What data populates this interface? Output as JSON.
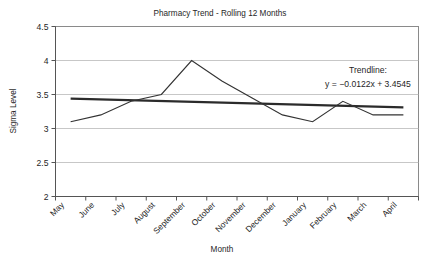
{
  "chart_data": {
    "type": "line",
    "title": "Pharmacy Trend - Rolling 12 Months",
    "xlabel": "Month",
    "ylabel": "Sigma Level",
    "categories": [
      "May",
      "June",
      "July",
      "August",
      "September",
      "October",
      "November",
      "December",
      "January",
      "February",
      "March",
      "April"
    ],
    "ylim": [
      2,
      4.5
    ],
    "yticks": [
      "2",
      "2.5",
      "3",
      "3.5",
      "4",
      "4.5"
    ],
    "ytick_values": [
      2,
      2.5,
      3,
      3.5,
      4,
      4.5
    ],
    "grid": true,
    "legend": "none",
    "series": [
      {
        "name": "Sigma Level",
        "values": [
          3.1,
          3.2,
          3.4,
          3.5,
          4.0,
          3.7,
          3.45,
          3.2,
          3.1,
          3.4,
          3.2,
          3.2
        ]
      },
      {
        "name": "Trendline",
        "values": [
          3.44,
          3.43,
          3.42,
          3.41,
          3.39,
          3.38,
          3.37,
          3.36,
          3.34,
          3.33,
          3.32,
          3.31
        ]
      }
    ],
    "annotations": {
      "trendline_label": "Trendline:",
      "trendline_equation": "y = −0.0122x + 3.4545"
    },
    "colors": {
      "series_line": "#333333",
      "trend_line": "#2b2b2b",
      "grid": "#b9b9b9",
      "frame": "#8a8a8a",
      "background": "#ffffff"
    }
  }
}
